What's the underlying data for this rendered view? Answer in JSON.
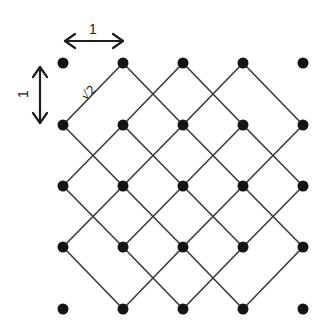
{
  "diagram": {
    "title": "",
    "grid": {
      "columns_x": [
        63,
        123,
        183,
        243,
        303
      ],
      "rows_y": [
        63,
        125,
        186,
        247,
        309
      ],
      "dot_radius": 5.5,
      "dot_color": "#141414",
      "line_color": "#3a3a3a",
      "omitted_line_endpoints": [
        "top-left",
        "top-right",
        "bottom-left",
        "bottom-right"
      ]
    },
    "labels": {
      "horizontal_spacing": "1",
      "vertical_spacing": "1",
      "diagonal_spacing": "√2"
    }
  }
}
